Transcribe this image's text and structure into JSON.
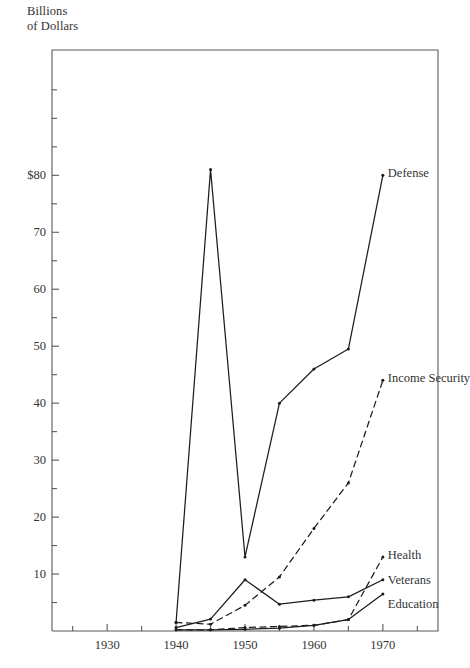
{
  "chart_data": {
    "type": "line",
    "title": "",
    "subtitle": "",
    "ylabel": "Billions\nof Dollars",
    "xlabel": "",
    "xlim": [
      1922,
      1978
    ],
    "ylim": [
      0,
      102
    ],
    "grid": false,
    "legend_position": "inline-right-of-line-ends",
    "x_ticks_major": [
      1930,
      1940,
      1950,
      1960,
      1970
    ],
    "x_tick_labels": [
      "1930",
      "1940",
      "1950",
      "1960",
      "1970"
    ],
    "x_ticks_minor": [
      1925,
      1935,
      1945,
      1955,
      1965,
      1975
    ],
    "y_ticks_major": [
      10,
      20,
      30,
      40,
      50,
      60,
      70,
      80
    ],
    "y_tick_labels": [
      "10",
      "20",
      "30",
      "40",
      "50",
      "60",
      "70",
      "$80"
    ],
    "y_ticks_minor": [
      5,
      15,
      25,
      35,
      45,
      55,
      65,
      75,
      85,
      90,
      95
    ],
    "series": [
      {
        "name": "Defense",
        "label": "Defense",
        "style": "solid",
        "x": [
          1940,
          1945,
          1950,
          1955,
          1960,
          1965,
          1970
        ],
        "values": [
          1.5,
          81,
          13,
          40,
          46,
          49.5,
          80
        ]
      },
      {
        "name": "Income Security",
        "label": "Income Security",
        "style": "dashed",
        "x": [
          1940,
          1945,
          1950,
          1955,
          1960,
          1965,
          1970
        ],
        "values": [
          1.5,
          1.2,
          4.5,
          9.5,
          18,
          26,
          44
        ]
      },
      {
        "name": "Health",
        "label": "Health",
        "style": "dashed",
        "x": [
          1940,
          1945,
          1950,
          1955,
          1960,
          1965,
          1970
        ],
        "values": [
          0.2,
          0.2,
          0.6,
          0.8,
          1.0,
          2.0,
          13
        ]
      },
      {
        "name": "Veterans",
        "label": "Veterans",
        "style": "solid",
        "x": [
          1940,
          1945,
          1950,
          1955,
          1960,
          1965,
          1970
        ],
        "values": [
          0.6,
          2.1,
          9.0,
          4.7,
          5.4,
          6.0,
          9.0
        ]
      },
      {
        "name": "Education",
        "label": "Education",
        "style": "solid",
        "x": [
          1940,
          1945,
          1950,
          1955,
          1960,
          1965,
          1970
        ],
        "values": [
          0.2,
          0.2,
          0.3,
          0.5,
          1.0,
          2.0,
          6.5
        ]
      }
    ]
  },
  "axis": {
    "y_title": "Billions\nof Dollars"
  },
  "labels": {
    "defense": "Defense",
    "income_security": "Income Security",
    "health": "Health",
    "veterans": "Veterans",
    "education": "Education"
  }
}
